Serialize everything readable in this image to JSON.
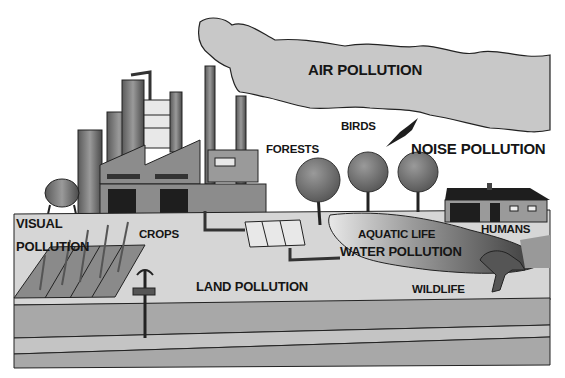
{
  "diagram": {
    "labels": {
      "air_pollution": "AIR POLLUTION",
      "birds": "BIRDS",
      "forests": "FORESTS",
      "noise_pollution": "NOISE POLLUTION",
      "visual_pollution_line1": "VISUAL",
      "visual_pollution_line2": "POLLUTION",
      "crops": "CROPS",
      "aquatic_life": "AQUATIC LIFE",
      "water_pollution": "WATER POLLUTION",
      "humans": "HUMANS",
      "land_pollution": "LAND POLLUTION",
      "wildlife": "WILDLIFE"
    },
    "elements": [
      "factory",
      "smokestacks",
      "smoke-cloud",
      "bird",
      "trees",
      "house",
      "crop-field",
      "water-tank",
      "pond",
      "animal",
      "signpost",
      "soil-layers"
    ],
    "colors": {
      "smoke": "#c8c8c8",
      "ground": "#d6d6d6",
      "soil": "#a8a8a8",
      "factory": "#8c8c8c",
      "outline": "#222222"
    }
  }
}
